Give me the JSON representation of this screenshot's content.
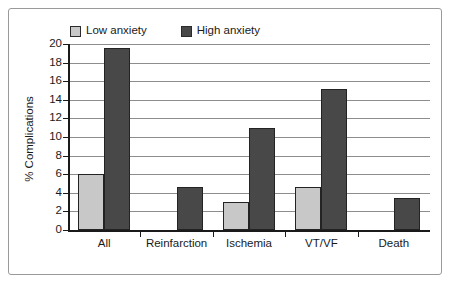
{
  "chart_data": {
    "type": "bar",
    "title": "",
    "xlabel": "",
    "ylabel": "% Complications",
    "ylim": [
      0,
      20
    ],
    "ytick_step": 2,
    "yticks": [
      "0",
      "2",
      "4",
      "6",
      "8",
      "10",
      "12",
      "14",
      "16",
      "18",
      "20"
    ],
    "grid": true,
    "legend_position": "top",
    "categories": [
      "All",
      "Reinfarction",
      "Ischemia",
      "VT/VF",
      "Death"
    ],
    "series": [
      {
        "name": "Low anxiety",
        "color": "#c8c8c8",
        "values": [
          6.0,
          0,
          3.0,
          4.6,
          0
        ]
      },
      {
        "name": "High anxiety",
        "color": "#484848",
        "values": [
          19.6,
          4.6,
          11.0,
          15.2,
          3.4
        ]
      }
    ]
  },
  "legend": {
    "entries": [
      {
        "label": "Low anxiety",
        "swatch": "legend-swatch-low-anxiety"
      },
      {
        "label": "High anxiety",
        "swatch": "legend-swatch-high-anxiety"
      }
    ]
  },
  "colors": {
    "low_anxiety": "#c8c8c8",
    "high_anxiety": "#484848",
    "axis": "#1a1a1a",
    "gridline": "#8d8d8d",
    "frame": "#9a9a9a",
    "background": "#ffffff"
  }
}
